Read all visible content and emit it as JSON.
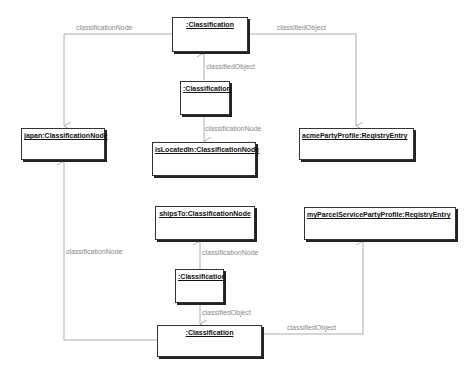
{
  "diagram": {
    "type": "UML object diagram",
    "nodes": [
      {
        "id": "cls_top",
        "label": ":Classification"
      },
      {
        "id": "cls_mid",
        "label": ":Classification"
      },
      {
        "id": "japan",
        "label": "japan:ClassificationNode"
      },
      {
        "id": "acme",
        "label": "acmePartyProfile:RegistryEntry"
      },
      {
        "id": "isLocatedIn",
        "label": "isLocatedIn:ClassificationNode"
      },
      {
        "id": "shipsTo",
        "label": "shipsTo:ClassificationNode"
      },
      {
        "id": "myParcel",
        "label": "myParcelServicePartyProfile:RegistryEntry"
      },
      {
        "id": "cls_low",
        "label": ":Classification"
      },
      {
        "id": "cls_bottom",
        "label": ":Classification"
      }
    ],
    "edges": [
      {
        "from": "cls_top",
        "to": "japan",
        "label": "classificationNode"
      },
      {
        "from": "cls_top",
        "to": "acme",
        "label": "classifiedObject"
      },
      {
        "from": "cls_mid",
        "to": "cls_top",
        "label": "classifiedObject"
      },
      {
        "from": "cls_mid",
        "to": "isLocatedIn",
        "label": "classificationNode"
      },
      {
        "from": "cls_bottom",
        "to": "japan",
        "label": "classificationNode"
      },
      {
        "from": "cls_low",
        "to": "shipsTo",
        "label": "classificationNode"
      },
      {
        "from": "cls_low",
        "to": "cls_bottom",
        "label": "classifiedObject"
      },
      {
        "from": "cls_bottom",
        "to": "myParcel",
        "label": "classifiedObject"
      }
    ]
  }
}
